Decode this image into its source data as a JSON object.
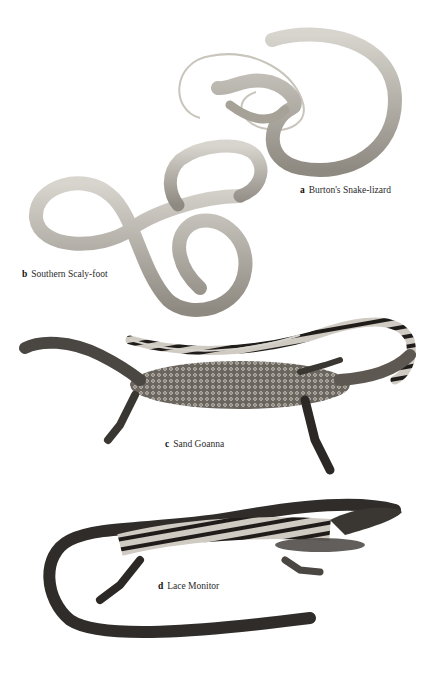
{
  "plate": {
    "background": "#ffffff",
    "specimens": [
      {
        "letter": "a",
        "name": "Burton's Snake-lizard",
        "tone": "#b8b4ab"
      },
      {
        "letter": "b",
        "name": "Southern Scaly-foot",
        "tone": "#bdb9b0"
      },
      {
        "letter": "c",
        "name": "Sand Goanna",
        "tone": "#5b5650"
      },
      {
        "letter": "d",
        "name": "Lace Monitor",
        "tone": "#2f2c29"
      }
    ]
  }
}
